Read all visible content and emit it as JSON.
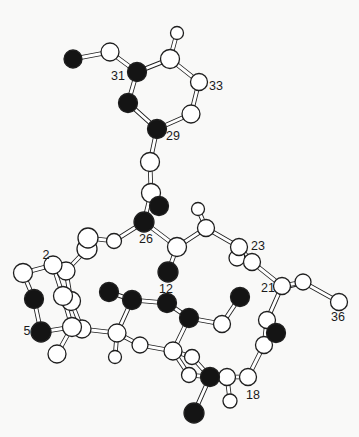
{
  "figure": {
    "width": 359,
    "height": 437,
    "background": "#f9f9f8",
    "bond_outline_color": "#1f1f1f",
    "bond_fill_color": "#ffffff",
    "bond_outer_width": 4.6,
    "bond_inner_width": 2.9,
    "atom_outline_color": "#1f1f1f",
    "atom_black_fill": "#141414",
    "atom_white_fill": "#ffffff",
    "label_color": "#1b1b1b",
    "label_font_size": 12.5
  },
  "molecule": {
    "atoms": [
      {
        "id": "W10",
        "x": 87,
        "y": 249,
        "shade": "white",
        "r": 10
      },
      {
        "id": "W9",
        "x": 88,
        "y": 238,
        "shade": "white",
        "r": 10
      },
      {
        "id": "W8",
        "x": 114,
        "y": 241,
        "shade": "white",
        "r": 7.5
      },
      {
        "id": "W12",
        "x": 66,
        "y": 271,
        "shade": "white",
        "r": 9
      },
      {
        "id": "W11",
        "x": 53,
        "y": 265,
        "shade": "white",
        "r": 9
      },
      {
        "id": "W13",
        "x": 23,
        "y": 273,
        "shade": "white",
        "r": 9.5
      },
      {
        "id": "W15",
        "x": 71,
        "y": 301,
        "shade": "white",
        "r": 9.5
      },
      {
        "id": "W14",
        "x": 63,
        "y": 296,
        "shade": "white",
        "r": 9.5
      },
      {
        "id": "W17",
        "x": 82,
        "y": 329,
        "shade": "white",
        "r": 9
      },
      {
        "id": "W16",
        "x": 72,
        "y": 327,
        "shade": "white",
        "r": 9.5
      },
      {
        "id": "W18",
        "x": 57,
        "y": 354,
        "shade": "white",
        "r": 9
      },
      {
        "id": "B12",
        "x": 34,
        "y": 299,
        "shade": "black",
        "r": 9.5
      },
      {
        "id": "B13",
        "x": 41,
        "y": 332,
        "shade": "black",
        "r": 10
      },
      {
        "id": "W19",
        "x": 117,
        "y": 333,
        "shade": "white",
        "r": 9
      },
      {
        "id": "W20",
        "x": 115,
        "y": 357,
        "shade": "white",
        "r": 6.5
      },
      {
        "id": "W21",
        "x": 140,
        "y": 345,
        "shade": "white",
        "r": 8
      },
      {
        "id": "W23",
        "x": 192,
        "y": 357,
        "shade": "white",
        "r": 7.5
      },
      {
        "id": "W24",
        "x": 189,
        "y": 375,
        "shade": "white",
        "r": 7.5
      },
      {
        "id": "W22",
        "x": 173,
        "y": 351,
        "shade": "white",
        "r": 9
      },
      {
        "id": "B8",
        "x": 109,
        "y": 292,
        "shade": "black",
        "r": 9.5
      },
      {
        "id": "B9",
        "x": 132,
        "y": 300,
        "shade": "black",
        "r": 9.5
      },
      {
        "id": "B10",
        "x": 167,
        "y": 303,
        "shade": "black",
        "r": 9.5
      },
      {
        "id": "B11",
        "x": 189,
        "y": 318,
        "shade": "black",
        "r": 9.5
      },
      {
        "id": "W30",
        "x": 222,
        "y": 324,
        "shade": "white",
        "r": 8.5
      },
      {
        "id": "B14",
        "x": 240,
        "y": 297,
        "shade": "black",
        "r": 9.5
      },
      {
        "id": "W1",
        "x": 110,
        "y": 52,
        "shade": "white",
        "r": 9
      },
      {
        "id": "B1",
        "x": 73,
        "y": 59,
        "shade": "black",
        "r": 9
      },
      {
        "id": "W3",
        "x": 177,
        "y": 33,
        "shade": "white",
        "r": 6.5
      },
      {
        "id": "W2",
        "x": 170,
        "y": 59,
        "shade": "white",
        "r": 9.5
      },
      {
        "id": "B2",
        "x": 137,
        "y": 72,
        "shade": "black",
        "r": 9.5
      },
      {
        "id": "W4",
        "x": 199,
        "y": 82,
        "shade": "white",
        "r": 8.5
      },
      {
        "id": "W5",
        "x": 191,
        "y": 114,
        "shade": "white",
        "r": 9
      },
      {
        "id": "B3",
        "x": 128,
        "y": 103,
        "shade": "black",
        "r": 9.5
      },
      {
        "id": "B4",
        "x": 157,
        "y": 129,
        "shade": "black",
        "r": 9.5
      },
      {
        "id": "W6",
        "x": 150,
        "y": 162,
        "shade": "white",
        "r": 9.5
      },
      {
        "id": "W7",
        "x": 151,
        "y": 193,
        "shade": "white",
        "r": 9.5
      },
      {
        "id": "B5",
        "x": 159,
        "y": 206,
        "shade": "black",
        "r": 9.5
      },
      {
        "id": "B6",
        "x": 144,
        "y": 222,
        "shade": "black",
        "r": 10
      },
      {
        "id": "B7",
        "x": 168,
        "y": 272,
        "shade": "black",
        "r": 10
      },
      {
        "id": "W31",
        "x": 177,
        "y": 247,
        "shade": "white",
        "r": 9.5
      },
      {
        "id": "W32",
        "x": 198,
        "y": 209,
        "shade": "white",
        "r": 6.5
      },
      {
        "id": "W33",
        "x": 206,
        "y": 228,
        "shade": "white",
        "r": 8.5
      },
      {
        "id": "W35",
        "x": 237,
        "y": 258,
        "shade": "white",
        "r": 8
      },
      {
        "id": "W34",
        "x": 239,
        "y": 247,
        "shade": "white",
        "r": 8.5
      },
      {
        "id": "W36",
        "x": 252,
        "y": 262,
        "shade": "white",
        "r": 8.5
      },
      {
        "id": "W37",
        "x": 282,
        "y": 286,
        "shade": "white",
        "r": 8.5
      },
      {
        "id": "W38",
        "x": 303,
        "y": 282,
        "shade": "white",
        "r": 8
      },
      {
        "id": "W39",
        "x": 339,
        "y": 302,
        "shade": "white",
        "r": 8.5
      },
      {
        "id": "W29",
        "x": 267,
        "y": 320,
        "shade": "white",
        "r": 8.5
      },
      {
        "id": "W28",
        "x": 264,
        "y": 345,
        "shade": "white",
        "r": 8.5
      },
      {
        "id": "B15",
        "x": 276,
        "y": 333,
        "shade": "black",
        "r": 9.5
      },
      {
        "id": "W27",
        "x": 248,
        "y": 377,
        "shade": "white",
        "r": 8.5
      },
      {
        "id": "W25",
        "x": 227,
        "y": 377,
        "shade": "white",
        "r": 8.5
      },
      {
        "id": "W26",
        "x": 230,
        "y": 401,
        "shade": "white",
        "r": 7
      },
      {
        "id": "B16",
        "x": 210,
        "y": 377,
        "shade": "black",
        "r": 9.5
      },
      {
        "id": "B17",
        "x": 194,
        "y": 413,
        "shade": "black",
        "r": 10
      }
    ],
    "bonds": [
      {
        "a": "B1",
        "b": "W1"
      },
      {
        "a": "W1",
        "b": "B2"
      },
      {
        "a": "B2",
        "b": "W2"
      },
      {
        "a": "W2",
        "b": "W3"
      },
      {
        "a": "W2",
        "b": "W4"
      },
      {
        "a": "W4",
        "b": "W5"
      },
      {
        "a": "W5",
        "b": "B4"
      },
      {
        "a": "B2",
        "b": "B3"
      },
      {
        "a": "B3",
        "b": "B4"
      },
      {
        "a": "B4",
        "b": "W6"
      },
      {
        "a": "W6",
        "b": "W7"
      },
      {
        "a": "W7",
        "b": "B6"
      },
      {
        "a": "W7",
        "b": "B5"
      },
      {
        "a": "B6",
        "b": "W8"
      },
      {
        "a": "W8",
        "b": "W9"
      },
      {
        "a": "W9",
        "b": "W10"
      },
      {
        "a": "W10",
        "b": "W12"
      },
      {
        "a": "W11",
        "b": "W12"
      },
      {
        "a": "W11",
        "b": "W13"
      },
      {
        "a": "W13",
        "b": "B12"
      },
      {
        "a": "B12",
        "b": "B13"
      },
      {
        "a": "B13",
        "b": "W16"
      },
      {
        "a": "W11",
        "b": "W14"
      },
      {
        "a": "W12",
        "b": "W15"
      },
      {
        "a": "W14",
        "b": "W16"
      },
      {
        "a": "W15",
        "b": "W17"
      },
      {
        "a": "W16",
        "b": "W18"
      },
      {
        "a": "W17",
        "b": "W19"
      },
      {
        "a": "W19",
        "b": "W20"
      },
      {
        "a": "W19",
        "b": "W21"
      },
      {
        "a": "W19",
        "b": "B9"
      },
      {
        "a": "W21",
        "b": "W22"
      },
      {
        "a": "W22",
        "b": "W23"
      },
      {
        "a": "W22",
        "b": "W24"
      },
      {
        "a": "W23",
        "b": "B16"
      },
      {
        "a": "W24",
        "b": "B16"
      },
      {
        "a": "W22",
        "b": "B11"
      },
      {
        "a": "B8",
        "b": "B9"
      },
      {
        "a": "B9",
        "b": "B10"
      },
      {
        "a": "B10",
        "b": "B11"
      },
      {
        "a": "B11",
        "b": "W30"
      },
      {
        "a": "W30",
        "b": "B14"
      },
      {
        "a": "B6",
        "b": "W31"
      },
      {
        "a": "W31",
        "b": "B7"
      },
      {
        "a": "W31",
        "b": "W33"
      },
      {
        "a": "W33",
        "b": "W32"
      },
      {
        "a": "W33",
        "b": "W34"
      },
      {
        "a": "W34",
        "b": "W36"
      },
      {
        "a": "W36",
        "b": "W37"
      },
      {
        "a": "W37",
        "b": "W38"
      },
      {
        "a": "W38",
        "b": "W39"
      },
      {
        "a": "W37",
        "b": "W29"
      },
      {
        "a": "W29",
        "b": "B15"
      },
      {
        "a": "W29",
        "b": "W28"
      },
      {
        "a": "W28",
        "b": "W27"
      },
      {
        "a": "W27",
        "b": "W25"
      },
      {
        "a": "W25",
        "b": "W26"
      },
      {
        "a": "W25",
        "b": "B16"
      },
      {
        "a": "B16",
        "b": "B17"
      }
    ],
    "double_bond_ticks": [
      {
        "x1": 243,
        "y1": 255,
        "x2": 251,
        "y2": 261
      },
      {
        "x1": 289,
        "y1": 288,
        "x2": 297,
        "y2": 286
      }
    ],
    "labels": [
      {
        "text": "31",
        "x": 118,
        "y": 77
      },
      {
        "text": "33",
        "x": 216,
        "y": 87
      },
      {
        "text": "29",
        "x": 173,
        "y": 137
      },
      {
        "text": "26",
        "x": 146,
        "y": 240
      },
      {
        "text": "2",
        "x": 46,
        "y": 256
      },
      {
        "text": "5",
        "x": 27,
        "y": 332
      },
      {
        "text": "12",
        "x": 166,
        "y": 290
      },
      {
        "text": "23",
        "x": 258,
        "y": 247
      },
      {
        "text": "21",
        "x": 268,
        "y": 289
      },
      {
        "text": "36",
        "x": 338,
        "y": 318
      },
      {
        "text": "18",
        "x": 253,
        "y": 396
      }
    ]
  }
}
